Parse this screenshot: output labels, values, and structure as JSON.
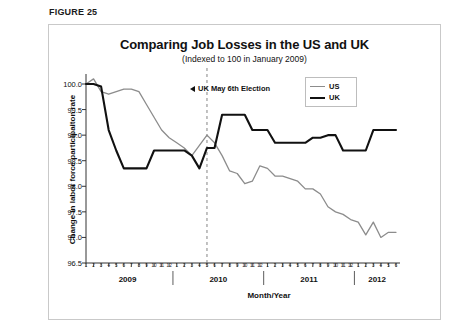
{
  "figure": {
    "label": "FIGURE 25"
  },
  "chart_data": {
    "type": "line",
    "title": "Comparing Job Losses in the US and UK",
    "subtitle": "(Indexed to 100 in January 2009)",
    "xlabel": "Month/Year",
    "ylabel": "Change in labor force participaiton rate",
    "ylim": [
      96.5,
      100.0
    ],
    "ytick_labels": [
      "100.0",
      "99.5",
      "99.0",
      "98.5",
      "98.0",
      "97.5",
      "97.0",
      "96.5"
    ],
    "ytick_values": [
      100.0,
      99.5,
      99.0,
      98.5,
      98.0,
      97.5,
      97.0,
      96.5
    ],
    "grid": false,
    "legend_position": "top-right",
    "years": [
      "2009",
      "2010",
      "2011",
      "2012"
    ],
    "month_ticks": [
      1,
      2,
      3,
      4,
      5,
      6,
      7,
      8,
      9,
      10,
      11,
      12,
      1,
      2,
      3,
      4,
      5,
      6,
      7,
      8,
      9,
      10,
      11,
      12,
      1,
      2,
      3,
      4,
      5,
      6,
      7,
      8,
      9,
      10,
      11,
      12,
      1,
      2,
      3,
      4,
      5,
      6
    ],
    "x": [
      "2009-01",
      "2009-02",
      "2009-03",
      "2009-04",
      "2009-05",
      "2009-06",
      "2009-07",
      "2009-08",
      "2009-09",
      "2009-10",
      "2009-11",
      "2009-12",
      "2010-01",
      "2010-02",
      "2010-03",
      "2010-04",
      "2010-05",
      "2010-06",
      "2010-07",
      "2010-08",
      "2010-09",
      "2010-10",
      "2010-11",
      "2010-12",
      "2011-01",
      "2011-02",
      "2011-03",
      "2011-04",
      "2011-05",
      "2011-06",
      "2011-07",
      "2011-08",
      "2011-09",
      "2011-10",
      "2011-11",
      "2011-12",
      "2012-01",
      "2012-02",
      "2012-03",
      "2012-04",
      "2012-05",
      "2012-06"
    ],
    "series": [
      {
        "name": "US",
        "color": "#8c8c8c",
        "values": [
          100.0,
          100.1,
          99.85,
          99.8,
          99.85,
          99.9,
          99.9,
          99.85,
          99.6,
          99.35,
          99.1,
          98.95,
          98.85,
          98.75,
          98.6,
          98.8,
          99.0,
          98.85,
          98.6,
          98.3,
          98.25,
          98.05,
          98.1,
          98.4,
          98.35,
          98.2,
          98.2,
          98.15,
          98.1,
          97.95,
          97.95,
          97.85,
          97.6,
          97.5,
          97.45,
          97.35,
          97.3,
          97.05,
          97.3,
          97.0,
          97.1,
          97.1
        ]
      },
      {
        "name": "UK",
        "color": "#111111",
        "values": [
          100.0,
          100.0,
          99.95,
          99.1,
          98.7,
          98.35,
          98.35,
          98.35,
          98.35,
          98.7,
          98.7,
          98.7,
          98.7,
          98.7,
          98.6,
          98.35,
          98.75,
          98.75,
          99.4,
          99.4,
          99.4,
          99.4,
          99.1,
          99.1,
          99.1,
          98.85,
          98.85,
          98.85,
          98.85,
          98.85,
          98.95,
          98.95,
          99.0,
          99.0,
          98.7,
          98.7,
          98.7,
          98.7,
          99.1,
          99.1,
          99.1,
          99.1
        ]
      }
    ],
    "annotations": [
      {
        "name": "uk-election",
        "text": "UK May 6th Election",
        "marker": "◀",
        "x": "2010-05",
        "line_style": "dashed"
      }
    ]
  }
}
